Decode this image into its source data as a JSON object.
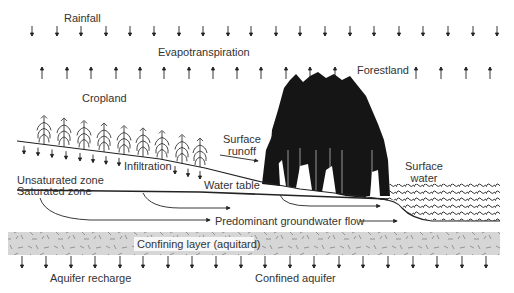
{
  "diagram": {
    "labels": {
      "rainfall": "Rainfall",
      "evapotranspiration": "Evapotranspiration",
      "forestland": "Forestland",
      "cropland": "Cropland",
      "surface_runoff_1": "Surface",
      "surface_runoff_2": "runoff",
      "infiltration": "Infiltration",
      "unsaturated_zone": "Unsaturated zone",
      "water_table": "Water table",
      "surface_water_1": "Surface",
      "surface_water_2": "water",
      "saturated_zone": "Saturated zone",
      "groundwater_flow": "Predominant groundwater flow",
      "confining_layer": "Confining layer (aquitard)",
      "aquifer_recharge": "Aquifer recharge",
      "confined_aquifer": "Confined aquifer"
    },
    "arrows": {
      "rainfall_x": [
        32,
        57,
        81,
        106,
        130,
        154,
        179,
        203,
        228,
        251,
        276,
        300,
        325,
        350,
        374,
        399,
        423,
        448,
        473,
        497
      ],
      "evapotranspiration_x": [
        42,
        67,
        91,
        116,
        140,
        164,
        189,
        213,
        237,
        261,
        286,
        310,
        335,
        416,
        441,
        466,
        490
      ],
      "infiltration_x": [
        24,
        38,
        52,
        66,
        80,
        93,
        106,
        119,
        175,
        188,
        200
      ],
      "recharge_x": [
        22,
        46,
        71,
        95,
        120,
        143,
        168,
        192,
        216,
        241,
        265,
        290,
        314,
        339,
        363,
        388,
        413,
        437,
        462,
        486
      ]
    },
    "colors": {
      "line": "#222222",
      "confining_layer": "#d6d6d6",
      "forest": "#151515",
      "text": "#333333"
    }
  }
}
